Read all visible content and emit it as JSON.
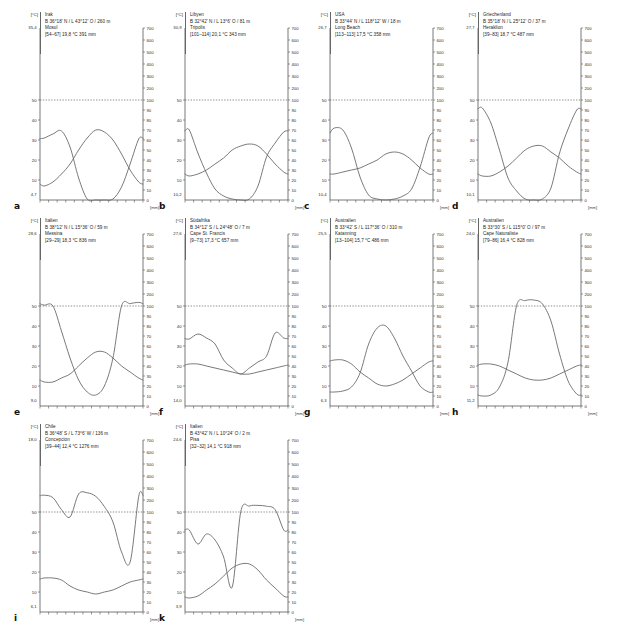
{
  "figure": {
    "axis_unit_left": "[°C]",
    "axis_unit_right": "[mm]",
    "left_ticks": [
      "50",
      "40",
      "30",
      "20",
      "10"
    ],
    "right_ticks_upper": [
      "700",
      "600",
      "500",
      "400",
      "300",
      "200"
    ],
    "right_ticks_lower": [
      "100",
      "90",
      "80",
      "70",
      "60",
      "50",
      "40",
      "30",
      "20",
      "10",
      "0"
    ],
    "humid_threshold_label": "100"
  },
  "panels": [
    {
      "letter": "a",
      "country": "Irak",
      "coords": "B 36°18' N / L 43°12' O / 260 m",
      "station": "Mosul",
      "summary": "[54–67]  19,8 °C  391 mm",
      "t_max": "35,4",
      "t_min": "4,7",
      "chart_data": {
        "type": "line",
        "title": "Mosul",
        "xlabel": "",
        "ylabel": "°C / mm",
        "categories": [
          "J",
          "F",
          "M",
          "A",
          "M",
          "J",
          "J",
          "A",
          "S",
          "O",
          "N",
          "D"
        ],
        "series": [
          {
            "name": "Niederschlag",
            "unit": "mm",
            "values": [
              62,
              66,
              69,
              53,
              22,
              1,
              0,
              0,
              1,
              13,
              36,
              61
            ]
          },
          {
            "name": "Temperatur",
            "unit": "°C",
            "values": [
              7,
              9,
              13,
              18,
              25,
              31,
              35,
              34,
              30,
              23,
              15,
              9
            ]
          }
        ],
        "templim": [
          4.7,
          35.4
        ],
        "precip_threshold": 100,
        "grid": false
      }
    },
    {
      "letter": "b",
      "country": "Libyen",
      "coords": "B 32°42' N / L 13°6' O / 81 m",
      "station": "Tripolis",
      "summary": "[101–114]  20,1 °C  343 mm",
      "t_max": "30,9",
      "t_min": "10,2",
      "chart_data": {
        "type": "line",
        "title": "Tripolis",
        "xlabel": "",
        "ylabel": "°C / mm",
        "categories": [
          "J",
          "F",
          "M",
          "A",
          "M",
          "J",
          "J",
          "A",
          "S",
          "O",
          "N",
          "D"
        ],
        "series": [
          {
            "name": "Niederschlag",
            "unit": "mm",
            "values": [
              70,
              47,
              27,
              11,
              4,
              1,
              0,
              1,
              14,
              43,
              57,
              68
            ]
          },
          {
            "name": "Temperatur",
            "unit": "°C",
            "values": [
              12,
              13,
              15,
              18,
              21,
              25,
              27,
              28,
              27,
              23,
              18,
              14
            ]
          }
        ],
        "templim": [
          10.2,
          30.9
        ],
        "precip_threshold": 100,
        "grid": false
      }
    },
    {
      "letter": "c",
      "country": "USA",
      "coords": "B 33°44' N / L 118°12' W / 18 m",
      "station": "Long Beach",
      "summary": "[113–113]  17,5 °C  358 mm",
      "t_max": "26,7",
      "t_min": "10,4",
      "chart_data": {
        "type": "line",
        "title": "Long Beach",
        "xlabel": "",
        "ylabel": "°C / mm",
        "categories": [
          "J",
          "F",
          "M",
          "A",
          "M",
          "J",
          "J",
          "A",
          "S",
          "O",
          "N",
          "D"
        ],
        "series": [
          {
            "name": "Niederschlag",
            "unit": "mm",
            "values": [
              72,
              70,
              52,
              23,
              5,
              1,
              0,
              1,
              4,
              11,
              33,
              62
            ]
          },
          {
            "name": "Temperatur",
            "unit": "°C",
            "values": [
              13,
              14,
              15,
              16,
              18,
              20,
              23,
              24,
              23,
              20,
              16,
              13
            ]
          }
        ],
        "templim": [
          10.4,
          26.7
        ],
        "precip_threshold": 100,
        "grid": false
      }
    },
    {
      "letter": "d",
      "country": "Griechenland",
      "coords": "B 35°18' N / L 25°12' O / 37 m",
      "station": "Heraklion",
      "summary": "[39–83]  18,7 °C  487 mm",
      "t_max": "27,7",
      "t_min": "10,1",
      "chart_data": {
        "type": "line",
        "title": "Heraklion",
        "xlabel": "",
        "ylabel": "°C / mm",
        "categories": [
          "J",
          "F",
          "M",
          "A",
          "M",
          "J",
          "J",
          "A",
          "S",
          "O",
          "N",
          "D"
        ],
        "series": [
          {
            "name": "Niederschlag",
            "unit": "mm",
            "values": [
              92,
              77,
              50,
              22,
              9,
              1,
              0,
              1,
              12,
              47,
              71,
              90
            ]
          },
          {
            "name": "Temperatur",
            "unit": "°C",
            "values": [
              12,
              12,
              14,
              17,
              21,
              25,
              27,
              27,
              24,
              21,
              17,
              14
            ]
          }
        ],
        "templim": [
          10.1,
          27.7
        ],
        "precip_threshold": 100,
        "grid": false
      }
    },
    {
      "letter": "e",
      "country": "Italien",
      "coords": "B 38°12' N / L 15°36' O / 59 m",
      "station": "Messina",
      "summary": "[29–29]  18,3 °C  836 mm",
      "t_max": "28,6",
      "t_min": "9,0",
      "chart_data": {
        "type": "line",
        "title": "Messina",
        "xlabel": "",
        "ylabel": "°C / mm",
        "categories": [
          "J",
          "F",
          "M",
          "A",
          "M",
          "J",
          "J",
          "A",
          "S",
          "O",
          "N",
          "D"
        ],
        "series": [
          {
            "name": "Niederschlag",
            "unit": "mm",
            "values": [
              107,
              101,
              75,
              48,
              26,
              14,
              11,
              20,
              48,
              100,
              120,
              130
            ]
          },
          {
            "name": "Temperatur",
            "unit": "°C",
            "values": [
              12,
              12,
              14,
              16,
              20,
              24,
              27,
              27,
              24,
              20,
              17,
              14
            ]
          }
        ],
        "templim": [
          9.0,
          28.6
        ],
        "precip_threshold": 100,
        "grid": false
      }
    },
    {
      "letter": "f",
      "country": "Südafrika",
      "coords": "B 34°12' S / L 24°48' O / 7 m",
      "station": "Cape St. Francis",
      "summary": "[9–73]  17,3 °C  657 mm",
      "t_max": "27,6",
      "t_min": "14,0",
      "chart_data": {
        "type": "line",
        "title": "Cape St. Francis",
        "xlabel": "",
        "ylabel": "°C / mm",
        "categories": [
          "J",
          "F",
          "M",
          "A",
          "M",
          "J",
          "J",
          "A",
          "S",
          "O",
          "N",
          "D"
        ],
        "series": [
          {
            "name": "Niederschlag",
            "unit": "mm",
            "values": [
              67,
              72,
              68,
              62,
              46,
              38,
              32,
              38,
              44,
              50,
              73,
              68
            ]
          },
          {
            "name": "Temperatur",
            "unit": "°C",
            "values": [
              21,
              21,
              20,
              19,
              18,
              17,
              16,
              16,
              17,
              18,
              19,
              20
            ]
          }
        ],
        "templim": [
          14.0,
          27.6
        ],
        "precip_threshold": 100,
        "grid": false
      }
    },
    {
      "letter": "g",
      "country": "Australien",
      "coords": "B 33°42' S / L 117°36' O / 310 m",
      "station": "Katanning",
      "summary": "[13–104]  15,7 °C  486 mm",
      "t_max": "25,5",
      "t_min": "6,3",
      "chart_data": {
        "type": "line",
        "title": "Katanning",
        "xlabel": "",
        "ylabel": "°C / mm",
        "categories": [
          "J",
          "F",
          "M",
          "A",
          "M",
          "J",
          "J",
          "A",
          "S",
          "O",
          "N",
          "D"
        ],
        "series": [
          {
            "name": "Niederschlag",
            "unit": "mm",
            "values": [
              14,
              15,
              19,
              33,
              62,
              78,
              80,
              68,
              50,
              35,
              20,
              14
            ]
          },
          {
            "name": "Temperatur",
            "unit": "°C",
            "values": [
              23,
              23,
              21,
              17,
              14,
              11,
              10,
              11,
              13,
              16,
              19,
              22
            ]
          }
        ],
        "templim": [
          6.3,
          25.5
        ],
        "precip_threshold": 100,
        "grid": false
      }
    },
    {
      "letter": "h",
      "country": "Australien",
      "coords": "B 33°30' S / L 115°0' O / 97 m",
      "station": "Cape Naturaliste",
      "summary": "[79–86]  16,4 °C  828 mm",
      "t_max": "24,0",
      "t_min": "11,2",
      "chart_data": {
        "type": "line",
        "title": "Cape Naturaliste",
        "xlabel": "",
        "ylabel": "°C / mm",
        "categories": [
          "J",
          "F",
          "M",
          "A",
          "M",
          "J",
          "J",
          "A",
          "S",
          "O",
          "N",
          "D"
        ],
        "series": [
          {
            "name": "Niederschlag",
            "unit": "mm",
            "values": [
              10,
              11,
              19,
              44,
              104,
              145,
              150,
              118,
              85,
              52,
              25,
              12
            ]
          },
          {
            "name": "Temperatur",
            "unit": "°C",
            "values": [
              21,
              21,
              20,
              18,
              16,
              14,
              13,
              13,
              14,
              16,
              18,
              20
            ]
          }
        ],
        "templim": [
          11.2,
          24.0
        ],
        "precip_threshold": 100,
        "grid": false
      }
    },
    {
      "letter": "i",
      "country": "Chile",
      "coords": "B 36°48' S / L 73°6' W / 136 m",
      "station": "Concepcion",
      "summary": "[39–44]  12,4 °C  1276 mm",
      "t_max": "18,0",
      "t_min": "6,1",
      "chart_data": {
        "type": "line",
        "title": "Concepcion",
        "xlabel": "",
        "ylabel": "°C / mm",
        "categories": [
          "J",
          "F",
          "M",
          "A",
          "M",
          "J",
          "J",
          "A",
          "S",
          "O",
          "N",
          "D"
        ],
        "series": [
          {
            "name": "Niederschlag",
            "unit": "mm",
            "values": [
              240,
              220,
              120,
              95,
              250,
              260,
              230,
              145,
              90,
              60,
              50,
              230
            ]
          },
          {
            "name": "Temperatur",
            "unit": "°C",
            "values": [
              17,
              17,
              16,
              13,
              11,
              10,
              9,
              10,
              11,
              13,
              15,
              16
            ]
          }
        ],
        "templim": [
          6.1,
          18.0
        ],
        "precip_threshold": 100,
        "grid": false
      }
    },
    {
      "letter": "k",
      "country": "Italien",
      "coords": "B 43°42' N / L 10°24' O / 2 m",
      "station": "Pisa",
      "summary": "[32–32]  14,1 °C  918 mm",
      "t_max": "24,6",
      "t_min": "3,9",
      "chart_data": {
        "type": "line",
        "title": "Pisa",
        "xlabel": "",
        "ylabel": "°C / mm",
        "categories": [
          "J",
          "F",
          "M",
          "A",
          "M",
          "J",
          "J",
          "A",
          "S",
          "O",
          "N",
          "D"
        ],
        "series": [
          {
            "name": "Niederschlag",
            "unit": "mm",
            "values": [
              82,
              68,
              78,
              72,
              55,
              25,
              103,
              150,
              155,
              148,
              120,
              82
            ]
          },
          {
            "name": "Temperatur",
            "unit": "°C",
            "values": [
              7,
              8,
              11,
              14,
              18,
              22,
              24,
              24,
              21,
              16,
              12,
              8
            ]
          }
        ],
        "templim": [
          3.9,
          24.6
        ],
        "precip_threshold": 100,
        "grid": false
      }
    }
  ]
}
